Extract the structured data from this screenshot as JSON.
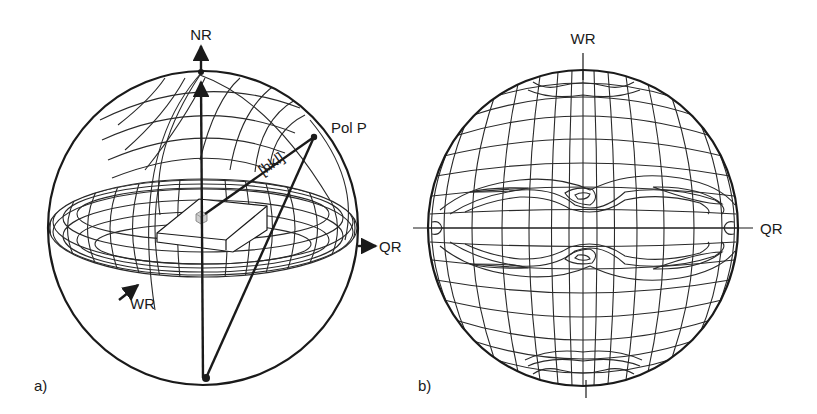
{
  "figure": {
    "panel_a": {
      "label": "a)",
      "axes": {
        "normal_direction": "NR",
        "transverse_direction": "QR",
        "rolling_direction": "WR"
      },
      "pole_label": "Pol P",
      "direction_label": "[hkl]"
    },
    "panel_b": {
      "label": "b)",
      "axes": {
        "top": "WR",
        "right": "QR"
      }
    },
    "colors": {
      "line": "#1a1a1a",
      "background": "#ffffff",
      "cube_fill": "#cfcfcf"
    }
  }
}
